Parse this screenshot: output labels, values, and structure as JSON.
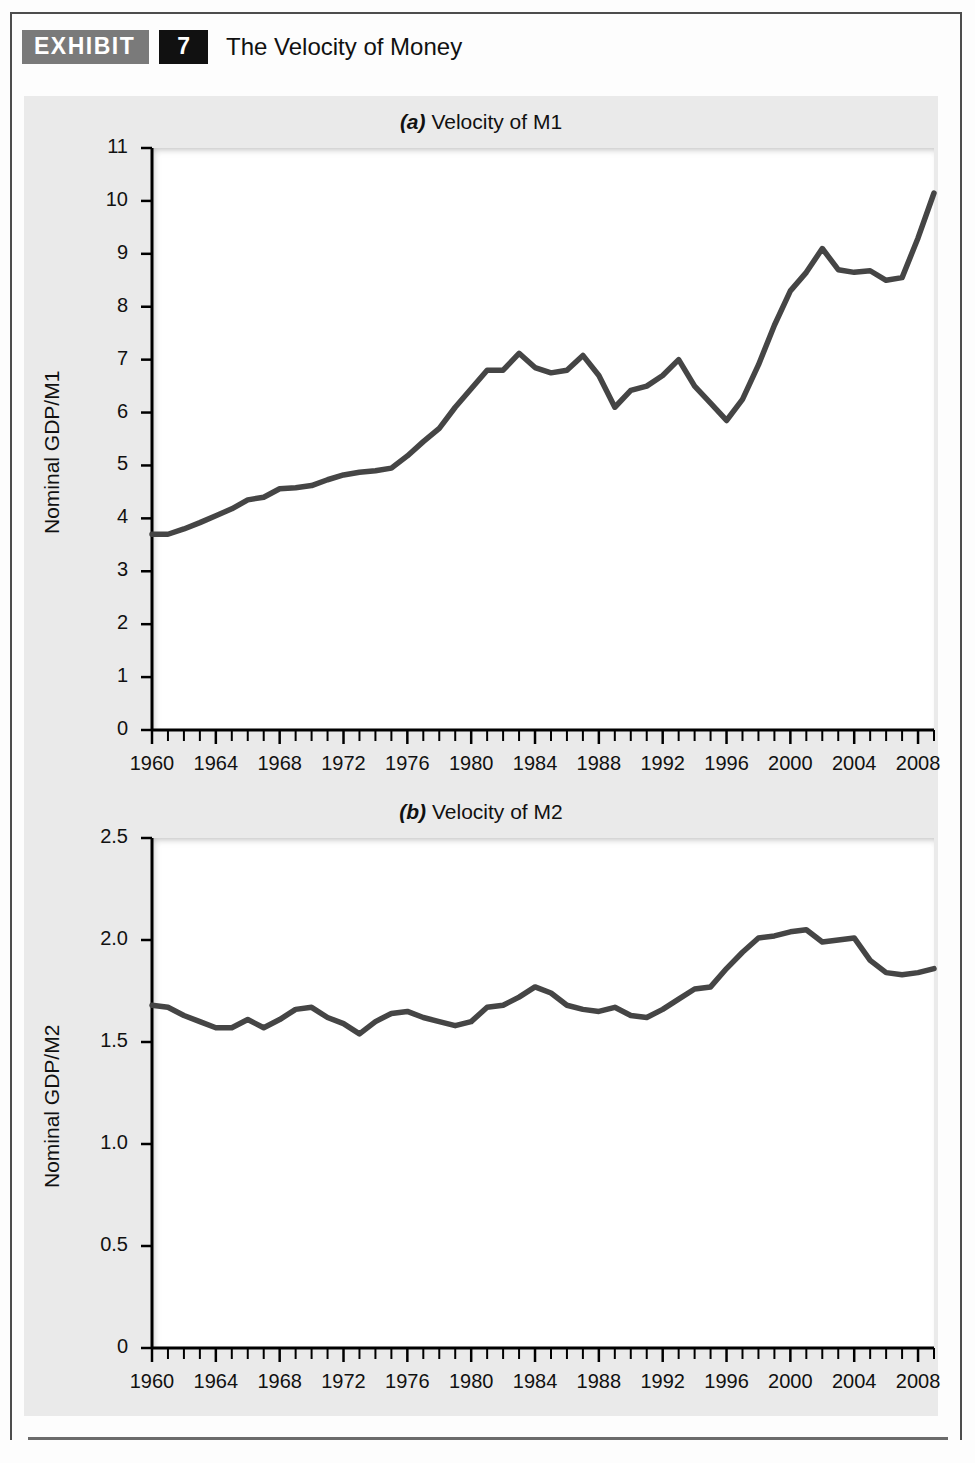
{
  "exhibit": {
    "tag_label": "EXHIBIT",
    "number": "7",
    "title": "The Velocity of Money"
  },
  "colors": {
    "line": "#454545",
    "panel_background": "#eaeaea",
    "plot_background": "#ffffff",
    "axis": "#000000",
    "tag_background": "#7a7a7a",
    "number_background": "#111111",
    "frame": "#4d4d4d"
  },
  "chart_data": [
    {
      "id": "velocity-m1",
      "type": "line",
      "title_prefix": "(a)",
      "title": "Velocity of M1",
      "xlabel": "",
      "ylabel": "Nominal GDP/M1",
      "ylim": [
        0,
        11
      ],
      "xlim": [
        1960,
        2009
      ],
      "yticks": [
        0,
        1,
        2,
        3,
        4,
        5,
        6,
        7,
        8,
        9,
        10,
        11
      ],
      "ytick_labels": [
        "0",
        "1",
        "2",
        "3",
        "4",
        "5",
        "6",
        "7",
        "8",
        "9",
        "10",
        "11"
      ],
      "xticks": [
        1960,
        1964,
        1968,
        1972,
        1976,
        1980,
        1984,
        1988,
        1992,
        1996,
        2000,
        2004,
        2008
      ],
      "xtick_labels": [
        "1960",
        "1964",
        "1968",
        "1972",
        "1976",
        "1980",
        "1984",
        "1988",
        "1992",
        "1996",
        "2000",
        "2004",
        "2008"
      ],
      "minor_xtick_interval": 1,
      "grid": false,
      "legend": "none",
      "x": [
        1960,
        1961,
        1962,
        1963,
        1964,
        1965,
        1966,
        1967,
        1968,
        1969,
        1970,
        1971,
        1972,
        1973,
        1974,
        1975,
        1976,
        1977,
        1978,
        1979,
        1980,
        1981,
        1982,
        1983,
        1984,
        1985,
        1986,
        1987,
        1988,
        1989,
        1990,
        1991,
        1992,
        1993,
        1994,
        1995,
        1996,
        1997,
        1998,
        1999,
        2000,
        2001,
        2002,
        2003,
        2004,
        2005,
        2006,
        2007,
        2008,
        2009
      ],
      "values": [
        3.7,
        3.7,
        3.8,
        3.92,
        4.05,
        4.18,
        4.35,
        4.4,
        4.56,
        4.58,
        4.62,
        4.73,
        4.82,
        4.87,
        4.9,
        4.95,
        5.18,
        5.45,
        5.7,
        6.1,
        6.45,
        6.8,
        6.8,
        7.12,
        6.85,
        6.75,
        6.8,
        7.08,
        6.7,
        6.1,
        6.42,
        6.5,
        6.7,
        7.0,
        6.5,
        6.18,
        5.85,
        6.25,
        6.9,
        7.65,
        8.3,
        8.65,
        9.1,
        8.7,
        8.65,
        8.68,
        8.5,
        8.55,
        9.3,
        10.15
      ]
    },
    {
      "id": "velocity-m2",
      "type": "line",
      "title_prefix": "(b)",
      "title": "Velocity of M2",
      "xlabel": "",
      "ylabel": "Nominal GDP/M2",
      "ylim": [
        0,
        2.5
      ],
      "xlim": [
        1960,
        2009
      ],
      "yticks": [
        0,
        0.5,
        1.0,
        1.5,
        2.0,
        2.5
      ],
      "ytick_labels": [
        "0",
        "0.5",
        "1.0",
        "1.5",
        "2.0",
        "2.5"
      ],
      "xticks": [
        1960,
        1964,
        1968,
        1972,
        1976,
        1980,
        1984,
        1988,
        1992,
        1996,
        2000,
        2004,
        2008
      ],
      "xtick_labels": [
        "1960",
        "1964",
        "1968",
        "1972",
        "1976",
        "1980",
        "1984",
        "1988",
        "1992",
        "1996",
        "2000",
        "2004",
        "2008"
      ],
      "minor_xtick_interval": 1,
      "grid": false,
      "legend": "none",
      "x": [
        1960,
        1961,
        1962,
        1963,
        1964,
        1965,
        1966,
        1967,
        1968,
        1969,
        1970,
        1971,
        1972,
        1973,
        1974,
        1975,
        1976,
        1977,
        1978,
        1979,
        1980,
        1981,
        1982,
        1983,
        1984,
        1985,
        1986,
        1987,
        1988,
        1989,
        1990,
        1991,
        1992,
        1993,
        1994,
        1995,
        1996,
        1997,
        1998,
        1999,
        2000,
        2001,
        2002,
        2003,
        2004,
        2005,
        2006,
        2007,
        2008,
        2009
      ],
      "values": [
        1.68,
        1.67,
        1.63,
        1.6,
        1.57,
        1.57,
        1.61,
        1.57,
        1.61,
        1.66,
        1.67,
        1.62,
        1.59,
        1.54,
        1.6,
        1.64,
        1.65,
        1.62,
        1.6,
        1.58,
        1.6,
        1.67,
        1.68,
        1.72,
        1.77,
        1.74,
        1.68,
        1.66,
        1.65,
        1.67,
        1.63,
        1.62,
        1.66,
        1.71,
        1.76,
        1.77,
        1.86,
        1.94,
        2.01,
        2.02,
        2.04,
        2.05,
        1.99,
        2.0,
        2.01,
        1.9,
        1.84,
        1.83,
        1.84,
        1.86
      ]
    }
  ]
}
